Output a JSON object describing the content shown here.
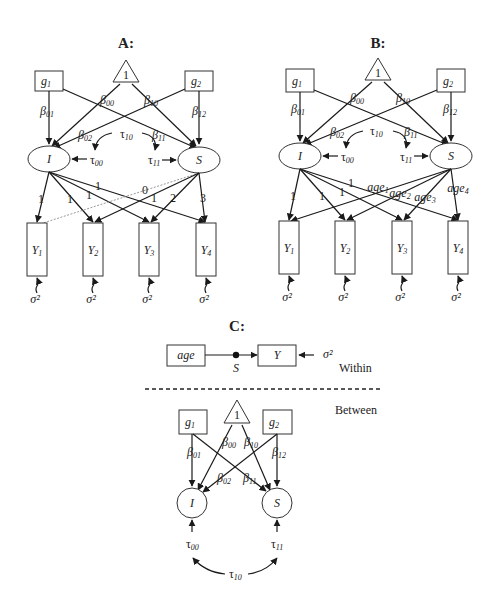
{
  "panels": {
    "A": {
      "title": "A:",
      "intercept_node": "1",
      "predictors": [
        "g",
        "g"
      ],
      "predictor_subs": [
        "1",
        "2"
      ],
      "latent": [
        "I",
        "S"
      ],
      "betas": {
        "b00": "00",
        "b10": "10",
        "b01": "01",
        "b02": "02",
        "b11": "11",
        "b12": "12"
      },
      "taus": {
        "t10": "10",
        "t00": "00",
        "t11": "11"
      },
      "intercept_loadings": [
        "1",
        "1",
        "1",
        "1"
      ],
      "slope_loadings": [
        "0",
        "1",
        "2",
        "3"
      ],
      "observed": [
        "Y",
        "Y",
        "Y",
        "Y"
      ],
      "observed_subs": [
        "1",
        "2",
        "3",
        "4"
      ],
      "residual": "σ²"
    },
    "B": {
      "title": "B:",
      "intercept_node": "1",
      "predictors": [
        "g",
        "g"
      ],
      "predictor_subs": [
        "1",
        "2"
      ],
      "latent": [
        "I",
        "S"
      ],
      "betas": {
        "b00": "00",
        "b10": "10",
        "b01": "01",
        "b02": "02",
        "b11": "11",
        "b12": "12"
      },
      "taus": {
        "t10": "10",
        "t00": "00",
        "t11": "11"
      },
      "intercept_loadings": [
        "1",
        "1",
        "1",
        "1"
      ],
      "slope_loadings": [
        "age",
        "age",
        "age",
        "age"
      ],
      "slope_loading_subs": [
        "1",
        "2",
        "3",
        "4"
      ],
      "observed": [
        "Y",
        "Y",
        "Y",
        "Y"
      ],
      "observed_subs": [
        "1",
        "2",
        "3",
        "4"
      ],
      "residual": "σ²"
    },
    "C": {
      "title": "C:",
      "within": {
        "label": "Within",
        "predictor": "age",
        "outcome": "Y",
        "random_slope": "S",
        "residual": "σ²"
      },
      "between": {
        "label": "Between",
        "intercept_node": "1",
        "predictors": [
          "g",
          "g"
        ],
        "predictor_subs": [
          "1",
          "2"
        ],
        "latent": [
          "I",
          "S"
        ],
        "betas": {
          "b00": "00",
          "b10": "10",
          "b01": "01",
          "b02": "02",
          "b11": "11",
          "b12": "12"
        },
        "taus": {
          "t00": "00",
          "t11": "11",
          "t10": "10"
        }
      }
    }
  },
  "symbols": {
    "beta": "β",
    "tau": "τ",
    "sigma": "σ",
    "sq": "2"
  }
}
